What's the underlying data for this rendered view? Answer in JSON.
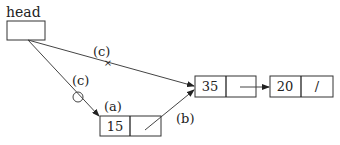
{
  "diagram": {
    "head_label": "head",
    "nodes": [
      {
        "id": "n15",
        "value": "15",
        "next": ""
      },
      {
        "id": "n35",
        "value": "35",
        "next": ""
      },
      {
        "id": "n20",
        "value": "20",
        "next": "/"
      }
    ],
    "edge_labels": {
      "a": "(a)",
      "b": "(b)",
      "c_top": "(c)",
      "c_lower": "(c)"
    },
    "markers": {
      "cross": "×",
      "circle": "○"
    }
  }
}
